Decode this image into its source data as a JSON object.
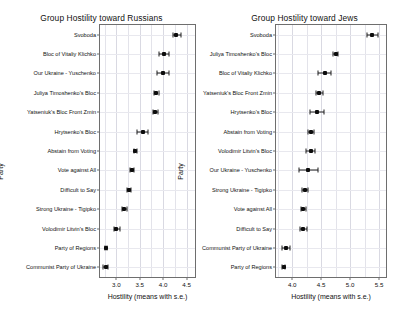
{
  "figure": {
    "width": 406,
    "height": 318,
    "background": "#ffffff",
    "point_color": "#0d0d0d",
    "grid_color": "#e3e3ea",
    "axis_color": "#6e6e6e"
  },
  "chart_data": [
    {
      "type": "scatter",
      "id": "russians",
      "title": "Group Hostility toward Russians",
      "xlabel": "Hostility (means with s.e.)",
      "ylabel": "Party",
      "grid": true,
      "legend": "none",
      "orientation": "horizontal-dotplot-with-error-bars",
      "xlim": [
        2.65,
        4.68
      ],
      "xticks": [
        3.0,
        3.5,
        4.0,
        4.5
      ],
      "xticklabels": [
        "3.0",
        "3.5",
        "4.0",
        "4.5"
      ],
      "categories": [
        "Svoboda",
        "Bloc of Vitaliy Klichko",
        "Our Ukraine - Yuschenko",
        "Juliya Timoshenko's Bloc",
        "Yatseniuk's Bloc Front Zmin",
        "Hrytsenko's Bloc",
        "Abstain from Voting",
        "Vote against All",
        "Difficult to Say",
        "Strong Ukraine - Tigipko",
        "Volodimir Litvin's Bloc",
        "Party of Regions",
        "Communist Party of Ukraine"
      ],
      "means": [
        4.28,
        4.02,
        4.0,
        3.85,
        3.83,
        3.56,
        3.4,
        3.33,
        3.26,
        3.17,
        3.0,
        2.78,
        2.77
      ],
      "se_low": [
        4.2,
        3.9,
        3.87,
        3.81,
        3.78,
        3.44,
        3.37,
        3.29,
        3.22,
        3.12,
        2.94,
        2.76,
        2.72
      ],
      "se_high": [
        4.38,
        4.12,
        4.13,
        3.9,
        3.88,
        3.68,
        3.43,
        3.38,
        3.31,
        3.22,
        3.07,
        2.81,
        2.83
      ]
    },
    {
      "type": "scatter",
      "id": "jews",
      "title": "Group Hostility toward Jews",
      "xlabel": "Hostility (means with s.e.)",
      "ylabel": "Party",
      "grid": true,
      "legend": "none",
      "orientation": "horizontal-dotplot-with-error-bars",
      "xlim": [
        3.72,
        5.62
      ],
      "xticks": [
        4.0,
        4.5,
        5.0,
        5.5
      ],
      "xticklabels": [
        "4.0",
        "4.5",
        "5.0",
        "5.5"
      ],
      "categories": [
        "Svoboda",
        "Juliya Timoshenko's Bloc",
        "Bloc of Vitaliy Klichko",
        "Yatseniuk's Bloc Front Zmin",
        "Hrytsenko's Bloc",
        "Abstain from Voting",
        "Volodimir Litvin's Bloc",
        "Our Ukraine - Yuschenko",
        "Strong Ukraine - Tigipko",
        "Vote against All",
        "Difficult to Say",
        "Communist Party of Ukraine",
        "Party of Regions"
      ],
      "means": [
        5.38,
        4.75,
        4.56,
        4.47,
        4.42,
        4.33,
        4.32,
        4.27,
        4.22,
        4.19,
        4.19,
        3.89,
        3.85
      ],
      "se_low": [
        5.29,
        4.71,
        4.45,
        4.41,
        4.3,
        4.28,
        4.24,
        4.11,
        4.17,
        4.15,
        4.14,
        3.82,
        3.83
      ],
      "se_high": [
        5.49,
        4.79,
        4.67,
        4.54,
        4.55,
        4.38,
        4.4,
        4.44,
        4.28,
        4.23,
        4.25,
        3.97,
        3.88
      ]
    }
  ]
}
